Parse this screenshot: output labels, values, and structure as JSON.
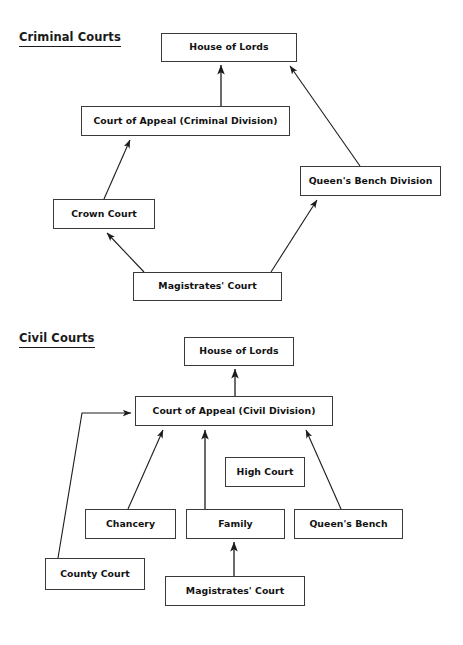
{
  "page": {
    "background_color": "#ffffff",
    "text_color": "#111111",
    "box_border_color": "#3a3a3a",
    "edge_color": "#2b2b2b",
    "width": 463,
    "height": 645
  },
  "sections": [
    {
      "id": "criminal",
      "heading": "Criminal Courts"
    },
    {
      "id": "civil",
      "heading": "Civil Courts"
    }
  ],
  "criminal": {
    "heading": "Criminal Courts",
    "nodes": [
      {
        "id": "crim-house-of-lords",
        "label": "House of Lords",
        "x": 161,
        "y": 33,
        "w": 136,
        "h": 29
      },
      {
        "id": "crim-court-of-appeal",
        "label": "Court of Appeal (Criminal Division)",
        "x": 81,
        "y": 106,
        "w": 209,
        "h": 30
      },
      {
        "id": "crim-queens-bench-division",
        "label": "Queen's Bench Division",
        "x": 300,
        "y": 166,
        "w": 141,
        "h": 30
      },
      {
        "id": "crim-crown-court",
        "label": "Crown Court",
        "x": 53,
        "y": 199,
        "w": 102,
        "h": 30
      },
      {
        "id": "crim-magistrates-court",
        "label": "Magistrates' Court",
        "x": 133,
        "y": 272,
        "w": 149,
        "h": 29
      }
    ],
    "edges": [
      {
        "from": "crim-court-of-appeal",
        "to": "crim-house-of-lords"
      },
      {
        "from": "crim-queens-bench-division",
        "to": "crim-house-of-lords"
      },
      {
        "from": "crim-crown-court",
        "to": "crim-court-of-appeal"
      },
      {
        "from": "crim-magistrates-court",
        "to": "crim-crown-court"
      },
      {
        "from": "crim-magistrates-court",
        "to": "crim-queens-bench-division"
      }
    ]
  },
  "civil": {
    "heading": "Civil Courts",
    "nodes": [
      {
        "id": "civ-house-of-lords",
        "label": "House of Lords",
        "x": 184,
        "y": 337,
        "w": 110,
        "h": 29
      },
      {
        "id": "civ-court-of-appeal",
        "label": "Court of Appeal (Civil Division)",
        "x": 135,
        "y": 396,
        "w": 198,
        "h": 30
      },
      {
        "id": "civ-high-court",
        "label": "High Court",
        "x": 225,
        "y": 457,
        "w": 80,
        "h": 30
      },
      {
        "id": "civ-chancery",
        "label": "Chancery",
        "x": 85,
        "y": 509,
        "w": 91,
        "h": 30
      },
      {
        "id": "civ-family",
        "label": "Family",
        "x": 186,
        "y": 509,
        "w": 99,
        "h": 30
      },
      {
        "id": "civ-queens-bench",
        "label": "Queen's Bench",
        "x": 294,
        "y": 509,
        "w": 109,
        "h": 30
      },
      {
        "id": "civ-county-court",
        "label": "County Court",
        "x": 45,
        "y": 558,
        "w": 100,
        "h": 32
      },
      {
        "id": "civ-magistrates-court",
        "label": "Magistrates' Court",
        "x": 165,
        "y": 576,
        "w": 140,
        "h": 30
      }
    ],
    "edges": [
      {
        "from": "civ-court-of-appeal",
        "to": "civ-house-of-lords"
      },
      {
        "from": "civ-chancery",
        "to": "civ-court-of-appeal"
      },
      {
        "from": "civ-family",
        "to": "civ-court-of-appeal"
      },
      {
        "from": "civ-queens-bench",
        "to": "civ-court-of-appeal"
      },
      {
        "from": "civ-county-court",
        "to": "civ-court-of-appeal"
      },
      {
        "from": "civ-magistrates-court",
        "to": "civ-family"
      }
    ]
  },
  "footer": {
    "note": ""
  }
}
